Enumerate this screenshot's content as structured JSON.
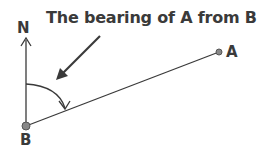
{
  "diagram": {
    "title": "The bearing of A from B",
    "labels": {
      "north": "N",
      "point_a": "A",
      "point_b": "B"
    },
    "points": {
      "B": {
        "x": 26,
        "y": 126
      },
      "A": {
        "x": 219,
        "y": 52
      }
    },
    "colors": {
      "line": "#3a3a3a",
      "point_fill": "#888888",
      "text": "#3a3a3a"
    }
  }
}
